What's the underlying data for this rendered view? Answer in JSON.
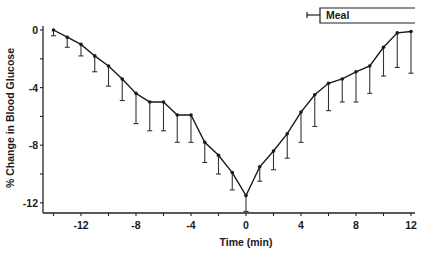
{
  "chart_data": {
    "type": "line",
    "title": "",
    "xlabel": "Time (min)",
    "ylabel": "% Change in Blood Glucose",
    "xlim": [
      -14.5,
      12.5
    ],
    "ylim": [
      -12.8,
      0.3
    ],
    "x_ticks": [
      -14,
      -12,
      -10,
      -8,
      -6,
      -4,
      -2,
      0,
      2,
      4,
      6,
      8,
      10,
      12
    ],
    "x_tick_labels": [
      "",
      "-12",
      "",
      "-8",
      "",
      "-4",
      "",
      "0",
      "",
      "4",
      "",
      "8",
      "",
      "12"
    ],
    "y_ticks": [
      0,
      -2,
      -4,
      -6,
      -8,
      -10,
      -12
    ],
    "y_tick_labels": [
      "0",
      "",
      "-4",
      "",
      "-8",
      "",
      "-12"
    ],
    "grid": false,
    "legend": null,
    "annotations": [
      {
        "type": "bracket",
        "label": "Meal",
        "x_start": 5,
        "x_end": 12,
        "position": "top-right"
      }
    ],
    "x": [
      -14,
      -13,
      -12,
      -11,
      -10,
      -9,
      -8,
      -7,
      -6,
      -5,
      -4,
      -3,
      -2,
      -1,
      0,
      1,
      2,
      3,
      4,
      5,
      6,
      7,
      8,
      9,
      10,
      11,
      12
    ],
    "series": [
      {
        "name": "% Change in Blood Glucose",
        "values": [
          0,
          -0.5,
          -1.0,
          -1.8,
          -2.5,
          -3.4,
          -4.4,
          -5.0,
          -5.0,
          -5.9,
          -5.9,
          -7.8,
          -8.7,
          -9.9,
          -11.5,
          -9.5,
          -8.4,
          -7.2,
          -5.7,
          -4.5,
          -3.7,
          -3.4,
          -2.9,
          -2.5,
          -1.2,
          -0.2,
          -0.1
        ],
        "error_lower": [
          -0.4,
          -1.2,
          -1.8,
          -2.9,
          -3.9,
          -4.9,
          -6.5,
          -7.0,
          -7.0,
          -7.8,
          -7.8,
          -9.2,
          -10.0,
          -11.1,
          -12.6,
          -10.5,
          -9.7,
          -8.9,
          -7.8,
          -6.7,
          -5.6,
          -5.0,
          -5.0,
          -4.4,
          -3.2,
          -2.6,
          -3.0
        ]
      }
    ]
  }
}
